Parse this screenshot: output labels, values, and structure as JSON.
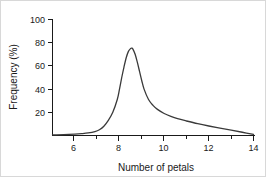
{
  "chart_data": {
    "type": "line",
    "title": "",
    "subtitle": "",
    "xlabel": "Number of petals",
    "ylabel": "Frequency (%)",
    "xlim": [
      5,
      14
    ],
    "ylim": [
      0,
      100
    ],
    "grid": false,
    "legend": null,
    "x_major_ticks": [
      6,
      8,
      10,
      12,
      14
    ],
    "x_minor_ticks": [
      7,
      9,
      11,
      13
    ],
    "x_tick_labels": [
      "6",
      "8",
      "10",
      "12",
      "14"
    ],
    "y_major_ticks": [
      20,
      40,
      60,
      80,
      100
    ],
    "y_tick_labels": [
      "20",
      "40",
      "60",
      "80",
      "100"
    ],
    "series": [
      {
        "name": "petal frequency distribution",
        "x": [
          5.0,
          5.5,
          6.0,
          6.3,
          6.6,
          6.9,
          7.1,
          7.3,
          7.5,
          7.7,
          7.9,
          8.0,
          8.1,
          8.2,
          8.3,
          8.4,
          8.5,
          8.55,
          8.6,
          8.7,
          8.8,
          8.9,
          9.0,
          9.1,
          9.3,
          9.5,
          9.7,
          10.0,
          10.3,
          10.6,
          11.0,
          11.5,
          12.0,
          12.5,
          13.0,
          13.5,
          14.0
        ],
        "values": [
          0.6,
          0.8,
          1.2,
          1.6,
          2.2,
          3.4,
          5.0,
          8.0,
          13.0,
          20.0,
          31.0,
          40.0,
          50.0,
          59.0,
          67.0,
          72.5,
          75.0,
          75.3,
          74.5,
          70.0,
          63.0,
          55.0,
          47.0,
          40.0,
          31.0,
          26.0,
          22.5,
          19.0,
          16.5,
          14.5,
          12.5,
          10.2,
          8.2,
          6.4,
          4.6,
          2.8,
          1.0
        ]
      }
    ]
  },
  "axes": {
    "x_axis_title": "Number of petals",
    "y_axis_title": "Frequency (%)"
  }
}
